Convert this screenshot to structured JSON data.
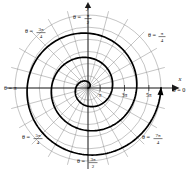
{
  "chart_data": {
    "type": "line",
    "title": "",
    "subtitle": "",
    "plot_kind": "polar-spiral",
    "curve_name": "Archimedean spiral",
    "equation": "r = θ",
    "xlabel": "x",
    "ylabel": "y",
    "grid": true,
    "legend": "none",
    "polar": {
      "radial_ticks": [
        {
          "label": "π",
          "value": 3.14159
        },
        {
          "label": "3π",
          "value": 9.42478
        },
        {
          "label": "5π",
          "value": 15.70796
        }
      ],
      "radial_max": 18.85,
      "circles_count": 6,
      "spokes_count": 24,
      "spoke_step_degrees": 15,
      "angle_labels": [
        {
          "text_prefix": "θ =",
          "value_whole": "0",
          "num": "",
          "den": "",
          "degrees": 0
        },
        {
          "text_prefix": "θ =",
          "value_whole": "",
          "num": "π",
          "den": "4",
          "degrees": 45
        },
        {
          "text_prefix": "θ =",
          "value_whole": "",
          "num": "π",
          "den": "2",
          "degrees": 90
        },
        {
          "text_prefix": "θ =",
          "value_whole": "",
          "num": "3π",
          "den": "4",
          "degrees": 135
        },
        {
          "text_prefix": "θ =",
          "value_whole": "π",
          "num": "",
          "den": "",
          "degrees": 180
        },
        {
          "text_prefix": "θ =",
          "value_whole": "",
          "num": "5π",
          "den": "4",
          "degrees": 225
        },
        {
          "text_prefix": "θ =",
          "value_whole": "",
          "num": "3π",
          "den": "2",
          "degrees": 270
        },
        {
          "text_prefix": "θ =",
          "value_whole": "",
          "num": "7π",
          "den": "4",
          "degrees": 315
        }
      ]
    },
    "direction": "counterclockwise",
    "arrow_at_end": true,
    "theta_range": [
      0,
      18.85
    ],
    "series": [
      {
        "name": "r = θ",
        "theta": [
          0,
          0.7854,
          1.5708,
          2.3562,
          3.1416,
          3.927,
          4.7124,
          5.4978,
          6.2832,
          7.0686,
          7.854,
          8.6394,
          9.4248,
          10.2102,
          10.9956,
          11.781,
          12.5664,
          13.3518,
          14.1372,
          14.9226,
          15.708,
          16.4934,
          17.2788,
          18.0642,
          18.8496
        ],
        "r": [
          0,
          0.7854,
          1.5708,
          2.3562,
          3.1416,
          3.927,
          4.7124,
          5.4978,
          6.2832,
          7.0686,
          7.854,
          8.6394,
          9.4248,
          10.2102,
          10.9956,
          11.781,
          12.5664,
          13.3518,
          14.1372,
          14.9226,
          15.708,
          16.4934,
          17.2788,
          18.0642,
          18.8496
        ]
      }
    ]
  },
  "labels": {
    "axis_x": "x",
    "axis_y": "y",
    "theta_eq": "θ =",
    "theta_zero": "θ = 0",
    "theta_pi": "θ = π",
    "tick_pi": "π",
    "tick_3pi": "3π",
    "tick_5pi": "5π",
    "num_pi": "π",
    "num_3pi": "3π",
    "num_5pi": "5π",
    "num_7pi": "7π",
    "den_2": "2",
    "den_4": "4"
  },
  "colors": {
    "background": "#ffffff",
    "grid": "#8a8a8a",
    "axis": "#1a1a1a",
    "curve": "#000000",
    "text": "#111111"
  }
}
